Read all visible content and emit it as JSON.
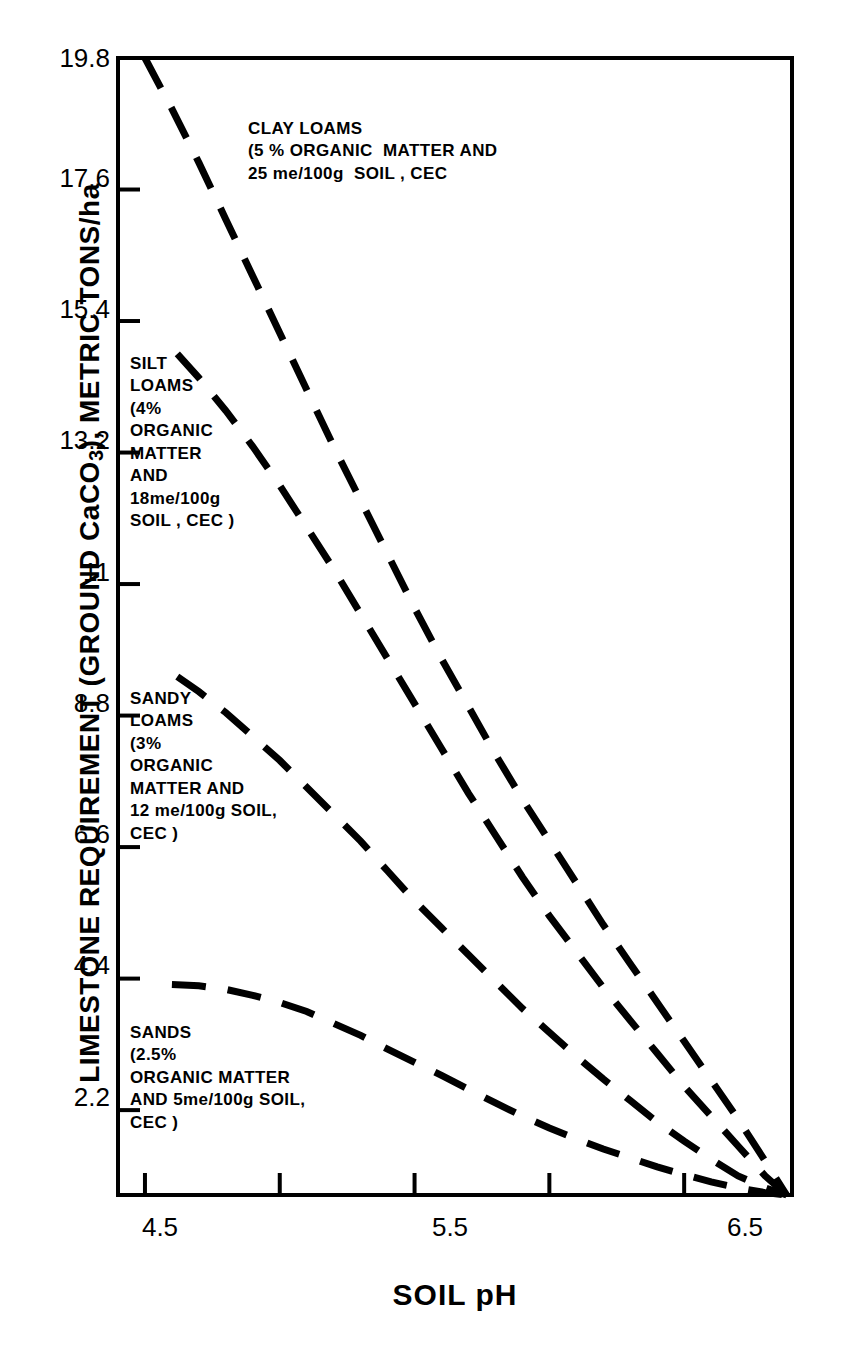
{
  "chart_data": {
    "type": "line",
    "title": "",
    "xlabel": "SOIL pH",
    "ylabel": "LIMESTONE REQUIREMENT (GROUND CaCO3), METRIC TONS/ha",
    "ylabel_parts": {
      "prefix": "LIMESTONE REQUIREMENT (GROUND CaCO",
      "subscript": "3",
      "suffix": "), METRIC TONS/ha"
    },
    "xlim": [
      4.4,
      6.9
    ],
    "ylim": [
      0.78,
      19.8
    ],
    "grid": false,
    "legend": "inline-annotations",
    "line_style": "dashed",
    "line_color": "#000000",
    "x_ticks": [
      {
        "value": 4.5,
        "label": "4.5"
      },
      {
        "value": 5.0,
        "label": ""
      },
      {
        "value": 5.5,
        "label": "5.5"
      },
      {
        "value": 6.0,
        "label": ""
      },
      {
        "value": 6.5,
        "label": "6.5"
      }
    ],
    "y_ticks": [
      {
        "value": 19.8,
        "label": "19.8"
      },
      {
        "value": 17.6,
        "label": "17.6"
      },
      {
        "value": 15.4,
        "label": "15.4"
      },
      {
        "value": 13.2,
        "label": "13.2"
      },
      {
        "value": 11.0,
        "label": "11"
      },
      {
        "value": 8.8,
        "label": "8.8"
      },
      {
        "value": 6.6,
        "label": "6.6"
      },
      {
        "value": 4.4,
        "label": "4.4"
      },
      {
        "value": 2.2,
        "label": "2.2"
      }
    ],
    "series": [
      {
        "name": "CLAY LOAMS",
        "label_lines": [
          "CLAY LOAMS",
          "(5 % ORGANIC  MATTER AND",
          "25 me/100g  SOIL , CEC"
        ],
        "x": [
          4.5,
          4.6,
          4.7,
          4.8,
          4.9,
          5.0,
          5.1,
          5.2,
          5.3,
          5.4,
          5.5,
          5.6,
          5.7,
          5.8,
          5.9,
          6.0,
          6.1,
          6.2,
          6.3,
          6.4,
          6.5,
          6.6,
          6.7,
          6.8,
          6.88
        ],
        "y": [
          19.8,
          18.95,
          18.05,
          17.1,
          16.15,
          15.2,
          14.25,
          13.3,
          12.4,
          11.5,
          10.6,
          9.75,
          8.95,
          8.15,
          7.4,
          6.7,
          6.0,
          5.3,
          4.65,
          4.0,
          3.35,
          2.7,
          2.05,
          1.35,
          0.78
        ]
      },
      {
        "name": "SILT LOAMS",
        "label_lines": [
          "SILT",
          "LOAMS",
          "(4%",
          "ORGANIC",
          "MATTER",
          "AND",
          "18me/100g",
          "SOIL , CEC )"
        ],
        "x": [
          4.62,
          4.7,
          4.8,
          4.9,
          5.0,
          5.1,
          5.2,
          5.3,
          5.4,
          5.5,
          5.6,
          5.7,
          5.8,
          5.9,
          6.0,
          6.1,
          6.2,
          6.3,
          6.4,
          6.5,
          6.6,
          6.7,
          6.8,
          6.88
        ],
        "y": [
          14.85,
          14.45,
          13.9,
          13.3,
          12.65,
          11.95,
          11.25,
          10.5,
          9.75,
          9.0,
          8.25,
          7.5,
          6.8,
          6.1,
          5.45,
          4.85,
          4.25,
          3.7,
          3.15,
          2.6,
          2.1,
          1.6,
          1.1,
          0.78
        ]
      },
      {
        "name": "SANDY LOAMS",
        "label_lines": [
          "SANDY",
          "LOAMS",
          "(3%",
          "ORGANIC",
          "MATTER AND",
          "12 me/100g SOIL,",
          "CEC )"
        ],
        "x": [
          4.62,
          4.7,
          4.8,
          4.9,
          5.0,
          5.1,
          5.2,
          5.3,
          5.4,
          5.5,
          5.6,
          5.7,
          5.8,
          5.9,
          6.0,
          6.1,
          6.2,
          6.3,
          6.4,
          6.5,
          6.6,
          6.7,
          6.8,
          6.88
        ],
        "y": [
          9.45,
          9.2,
          8.85,
          8.45,
          8.05,
          7.6,
          7.15,
          6.7,
          6.2,
          5.7,
          5.25,
          4.8,
          4.35,
          3.9,
          3.5,
          3.1,
          2.72,
          2.36,
          2.0,
          1.68,
          1.38,
          1.1,
          0.9,
          0.78
        ]
      },
      {
        "name": "SANDS",
        "label_lines": [
          "SANDS",
          "(2.5%",
          "ORGANIC MATTER",
          "AND 5me/100g SOIL,",
          "CEC )"
        ],
        "x": [
          4.6,
          4.7,
          4.8,
          4.9,
          5.0,
          5.1,
          5.2,
          5.3,
          5.4,
          5.5,
          5.6,
          5.7,
          5.8,
          5.9,
          6.0,
          6.1,
          6.2,
          6.3,
          6.4,
          6.5,
          6.6,
          6.7,
          6.8,
          6.88
        ],
        "y": [
          4.3,
          4.28,
          4.22,
          4.12,
          4.0,
          3.85,
          3.65,
          3.45,
          3.22,
          3.0,
          2.78,
          2.55,
          2.32,
          2.1,
          1.9,
          1.72,
          1.55,
          1.4,
          1.25,
          1.12,
          1.0,
          0.9,
          0.82,
          0.78
        ]
      }
    ],
    "annotations": [
      {
        "id": "clay-loams",
        "lines": [
          "CLAY LOAMS",
          "(5 % ORGANIC  MATTER AND",
          "25 me/100g  SOIL , CEC"
        ]
      },
      {
        "id": "silt-loams",
        "lines": [
          "SILT",
          "LOAMS",
          "(4%",
          "ORGANIC",
          "MATTER",
          "AND",
          "18me/100g",
          "SOIL , CEC )"
        ]
      },
      {
        "id": "sandy-loams",
        "lines": [
          "SANDY",
          "LOAMS",
          "(3%",
          "ORGANIC",
          "MATTER AND",
          "12 me/100g SOIL,",
          "CEC )"
        ]
      },
      {
        "id": "sands",
        "lines": [
          "SANDS",
          "(2.5%",
          "ORGANIC MATTER",
          "AND 5me/100g SOIL,",
          "CEC )"
        ]
      }
    ]
  },
  "axis": {
    "y_title_prefix": "LIMESTONE REQUIREMENT (GROUND CaCO",
    "y_title_sub": "3",
    "y_title_suffix": "), METRIC TONS/ha",
    "x_title": "SOIL pH"
  },
  "annotation_text": {
    "clay_loams": "CLAY LOAMS\n(5 % ORGANIC  MATTER AND\n25 me/100g  SOIL , CEC",
    "silt_loams": "SILT\nLOAMS\n(4%\nORGANIC\nMATTER\nAND\n18me/100g\nSOIL , CEC )",
    "sandy_loams": "SANDY\nLOAMS\n(3%\nORGANIC\nMATTER AND\n12 me/100g SOIL,\nCEC )",
    "sands": "SANDS\n(2.5%\nORGANIC MATTER\nAND 5me/100g SOIL,\nCEC )"
  },
  "y_tick_labels": {
    "t0": "19.8",
    "t1": "17.6",
    "t2": "15.4",
    "t3": "13.2",
    "t4": "11",
    "t5": "8.8",
    "t6": "6.6",
    "t7": "4.4",
    "t8": "2.2"
  },
  "x_tick_labels": {
    "t0": "4.5",
    "t1": "5.5",
    "t2": "6.5"
  },
  "colors": {
    "ink": "#000000",
    "background": "#ffffff"
  }
}
